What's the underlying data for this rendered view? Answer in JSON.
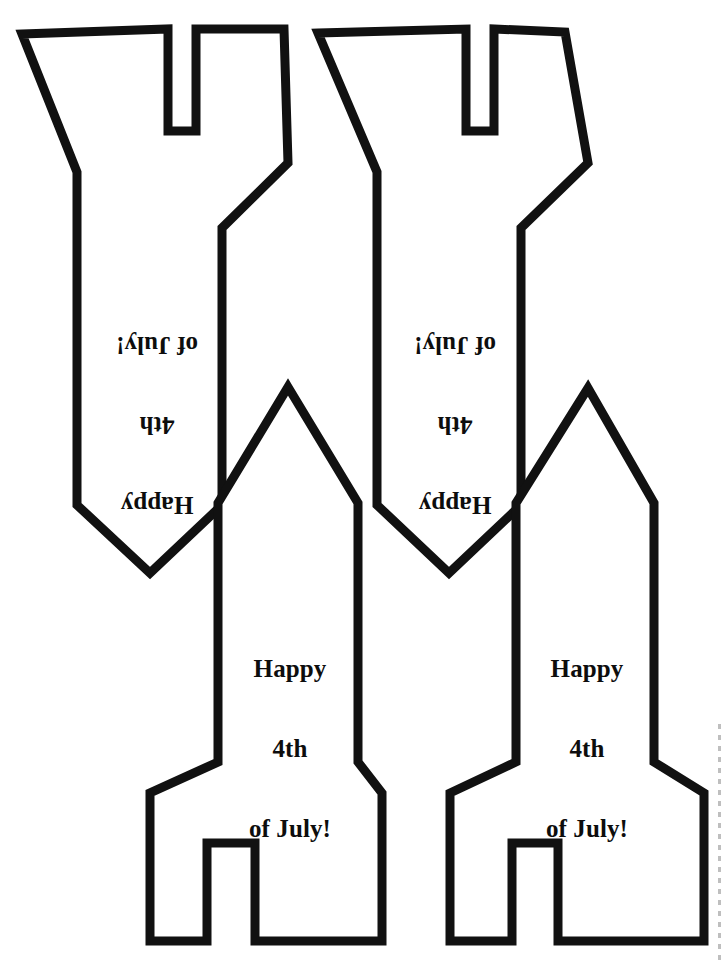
{
  "page": {
    "width": 721,
    "height": 965,
    "paper_color": "#ffffff",
    "ink_color": "#111111",
    "stroke_width": 9
  },
  "greeting": {
    "line1": "Happy",
    "line2": "4th",
    "line3": "of July!"
  },
  "rockets": [
    {
      "id": "rocket-top-left",
      "orientation": "inverted",
      "label_lines": [
        "Happy",
        "4th",
        "of July!"
      ],
      "label_x": 82,
      "label_y": 278,
      "label_width": 150,
      "points": "22,34 168,29 168,131 196,131 196,29 284,29 288,163 222,228 222,505 150,573 77,505 77,172"
    },
    {
      "id": "rocket-top-right",
      "orientation": "inverted",
      "label_lines": [
        "Happy",
        "4th",
        "of July!"
      ],
      "label_x": 380,
      "label_y": 278,
      "label_width": 150,
      "points": "318,33 466,29 466,131 494,131 494,29 565,32 588,163 521,228 521,505 449,573 377,505 377,172"
    },
    {
      "id": "rocket-bottom-left",
      "orientation": "upright",
      "label_lines": [
        "Happy",
        "4th",
        "of July!"
      ],
      "label_x": 215,
      "label_y": 602,
      "label_width": 150,
      "points": "288,387 358,503 358,762 382,793 382,941 255,941 255,843 207,843 207,941 150,941 150,793 218,762 218,503"
    },
    {
      "id": "rocket-bottom-right",
      "orientation": "upright",
      "label_lines": [
        "Happy",
        "4th",
        "of July!"
      ],
      "label_x": 512,
      "label_y": 602,
      "label_width": 150,
      "points": "588,388 654,503 654,762 704,793 704,941 558,941 558,843 512,843 512,941 450,941 450,793 516,762 516,503"
    }
  ],
  "scan_artifacts": {
    "right_edge_dashes": "dashed-scan-edge"
  }
}
